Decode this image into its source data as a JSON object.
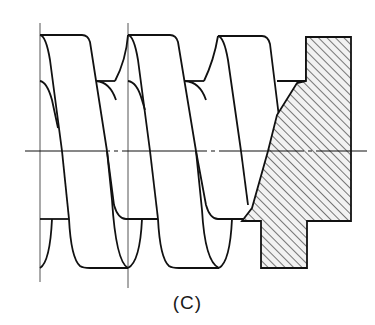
{
  "figure": {
    "caption": "(C)",
    "colors": {
      "line": "#111111",
      "thin_line": "#555555",
      "hatch": "#333333",
      "hatch_fill": "#f2f2f2",
      "background": "#ffffff"
    }
  }
}
